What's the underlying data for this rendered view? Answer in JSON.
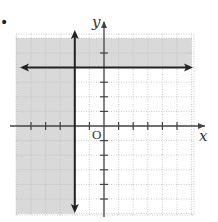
{
  "problem_marker": "•",
  "chart_data": {
    "type": "inequality-graph",
    "title": "",
    "xlabel": "x",
    "ylabel": "y",
    "origin_label": "O",
    "xlim": [
      -6,
      6
    ],
    "ylim": [
      -6,
      6
    ],
    "grid": true,
    "grid_style": "dotted",
    "tick_spacing": 1,
    "x_ticks": [
      -5,
      -4,
      -3,
      -1,
      1,
      2,
      3,
      4,
      5
    ],
    "y_ticks": [
      -5,
      -4,
      -3,
      -2,
      -1,
      1,
      2,
      3,
      5
    ],
    "boundary_lines": [
      {
        "equation": "y = 4",
        "orientation": "horizontal",
        "value": 4,
        "style": "solid"
      },
      {
        "equation": "x = -2",
        "orientation": "vertical",
        "value": -2,
        "style": "solid"
      }
    ],
    "shaded_regions": [
      {
        "description": "x <= -2",
        "bounds": {
          "x": [
            -6,
            -2
          ],
          "y": [
            -6,
            6
          ]
        }
      },
      {
        "description": "y >= 4",
        "bounds": {
          "x": [
            -6,
            6
          ],
          "y": [
            4,
            6
          ]
        }
      }
    ],
    "inequality": "x <= -2 or y >= 4",
    "colors": {
      "shade": "#d9d9d9",
      "axis": "#444444",
      "line": "#222222",
      "grid": "#bdbdbd"
    }
  }
}
